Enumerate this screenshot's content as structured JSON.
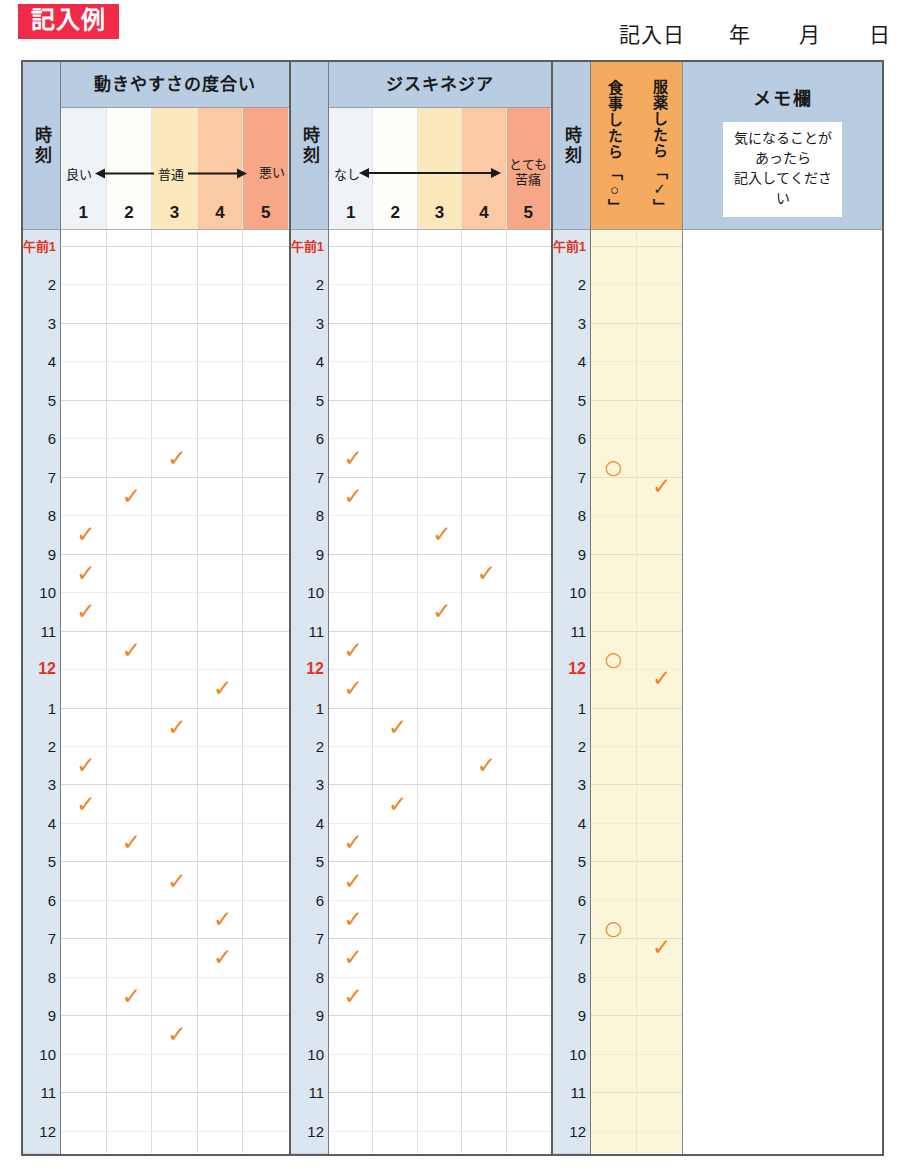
{
  "badge": {
    "label": "記入例"
  },
  "date_line": {
    "label": "記入日",
    "year": "年",
    "month": "月",
    "day": "日"
  },
  "time_labels": [
    "午前1",
    "2",
    "3",
    "4",
    "5",
    "6",
    "7",
    "8",
    "9",
    "10",
    "11",
    "12",
    "1",
    "2",
    "3",
    "4",
    "5",
    "6",
    "7",
    "8",
    "9",
    "10",
    "11",
    "12"
  ],
  "time_header": "時刻",
  "blocks": {
    "mobility": {
      "title": "動きやすさの度合い",
      "scale_low": "良い",
      "scale_mid": "普通",
      "scale_high": "悪い",
      "numbers": [
        "1",
        "2",
        "3",
        "4",
        "5"
      ],
      "colors": [
        "#eef3f8",
        "#fdfdfa",
        "#fbe9bd",
        "#fbc9a4",
        "#f6a787"
      ]
    },
    "dyskinesia": {
      "title": "ジスキネジア",
      "scale_low": "なし",
      "scale_mid": "",
      "scale_high": "とても\n苦痛",
      "scale_high_line1": "とても",
      "scale_high_line2": "苦痛",
      "numbers": [
        "1",
        "2",
        "3",
        "4",
        "5"
      ],
      "colors": [
        "#eef3f8",
        "#fdfdfa",
        "#fbe9bd",
        "#fbc9a4",
        "#f6a787"
      ]
    },
    "meal_med": {
      "meal_label": "食事したら",
      "meal_mark_label": "「○」",
      "med_label": "服薬したら",
      "med_mark_label": "「✓」",
      "meal_vertical": "食事したら\n「○」",
      "med_vertical": "服薬したら\n「✓」"
    },
    "memo": {
      "title": "メモ欄",
      "note_line1": "気になることが",
      "note_line2": "あったら",
      "note_line3": "記入してください"
    }
  },
  "colors": {
    "badge_bg": "#ef2b47",
    "header_blue": "#b9cde2",
    "time_col": "#dbe6f1",
    "orange_header": "#f4ab5f",
    "cream_body": "#fbf6da",
    "mark_orange": "#f28322",
    "red_hour": "#e03323"
  },
  "chart_data": {
    "type": "table",
    "row_slots": 24,
    "slot_labels": [
      "午前1",
      "2",
      "3",
      "4",
      "5",
      "6",
      "7",
      "8",
      "9",
      "10",
      "11",
      "12",
      "1",
      "2",
      "3",
      "4",
      "5",
      "6",
      "7",
      "8",
      "9",
      "10",
      "11",
      "12"
    ],
    "scale": [
      1,
      2,
      3,
      4,
      5
    ],
    "mobility_marks": [
      {
        "slot": "6-7",
        "slot_index": 5,
        "column": 3,
        "symbol": "✓"
      },
      {
        "slot": "7-8",
        "slot_index": 6,
        "column": 2,
        "symbol": "✓"
      },
      {
        "slot": "8-9",
        "slot_index": 7,
        "column": 1,
        "symbol": "✓"
      },
      {
        "slot": "9-10",
        "slot_index": 8,
        "column": 1,
        "symbol": "✓"
      },
      {
        "slot": "10-11",
        "slot_index": 9,
        "column": 1,
        "symbol": "✓"
      },
      {
        "slot": "11-12",
        "slot_index": 10,
        "column": 2,
        "symbol": "✓"
      },
      {
        "slot": "12-1",
        "slot_index": 11,
        "column": 4,
        "symbol": "✓"
      },
      {
        "slot": "1-2",
        "slot_index": 12,
        "column": 3,
        "symbol": "✓"
      },
      {
        "slot": "2-3",
        "slot_index": 13,
        "column": 1,
        "symbol": "✓"
      },
      {
        "slot": "3-4",
        "slot_index": 14,
        "column": 1,
        "symbol": "✓"
      },
      {
        "slot": "4-5",
        "slot_index": 15,
        "column": 2,
        "symbol": "✓"
      },
      {
        "slot": "5-6",
        "slot_index": 16,
        "column": 3,
        "symbol": "✓"
      },
      {
        "slot": "6-7",
        "slot_index": 17,
        "column": 4,
        "symbol": "✓"
      },
      {
        "slot": "7-8",
        "slot_index": 18,
        "column": 4,
        "symbol": "✓"
      },
      {
        "slot": "8-9",
        "slot_index": 19,
        "column": 2,
        "symbol": "✓"
      },
      {
        "slot": "9-10",
        "slot_index": 20,
        "column": 3,
        "symbol": "✓"
      }
    ],
    "dyskinesia_marks": [
      {
        "slot": "6-7",
        "slot_index": 5,
        "column": 1,
        "symbol": "✓"
      },
      {
        "slot": "7-8",
        "slot_index": 6,
        "column": 1,
        "symbol": "✓"
      },
      {
        "slot": "8-9",
        "slot_index": 7,
        "column": 3,
        "symbol": "✓"
      },
      {
        "slot": "9-10",
        "slot_index": 8,
        "column": 4,
        "symbol": "✓"
      },
      {
        "slot": "10-11",
        "slot_index": 9,
        "column": 3,
        "symbol": "✓"
      },
      {
        "slot": "11-12",
        "slot_index": 10,
        "column": 1,
        "symbol": "✓"
      },
      {
        "slot": "12-1",
        "slot_index": 11,
        "column": 1,
        "symbol": "✓"
      },
      {
        "slot": "1-2",
        "slot_index": 12,
        "column": 2,
        "symbol": "✓"
      },
      {
        "slot": "2-3",
        "slot_index": 13,
        "column": 4,
        "symbol": "✓"
      },
      {
        "slot": "3-4",
        "slot_index": 14,
        "column": 2,
        "symbol": "✓"
      },
      {
        "slot": "4-5",
        "slot_index": 15,
        "column": 1,
        "symbol": "✓"
      },
      {
        "slot": "5-6",
        "slot_index": 16,
        "column": 1,
        "symbol": "✓"
      },
      {
        "slot": "6-7",
        "slot_index": 17,
        "column": 1,
        "symbol": "✓"
      },
      {
        "slot": "7-8",
        "slot_index": 18,
        "column": 1,
        "symbol": "✓"
      },
      {
        "slot": "8-9",
        "slot_index": 19,
        "column": 1,
        "symbol": "✓"
      }
    ],
    "meal_marks": [
      {
        "slot_index": 6,
        "hour": "午前7",
        "symbol": "○"
      },
      {
        "slot_index": 11,
        "hour": "12",
        "symbol": "○"
      },
      {
        "slot_index": 18,
        "hour": "午後7",
        "symbol": "○"
      }
    ],
    "medication_marks": [
      {
        "slot_index": 6,
        "hour": "午前7",
        "symbol": "✓"
      },
      {
        "slot_index": 11,
        "hour": "12",
        "symbol": "✓"
      },
      {
        "slot_index": 18,
        "hour": "午後7",
        "symbol": "✓"
      }
    ]
  }
}
